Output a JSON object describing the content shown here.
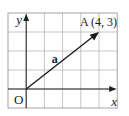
{
  "diagram": {
    "type": "vector-on-grid",
    "grid": {
      "columns": 6,
      "rows": 5,
      "left": 8,
      "top": 13,
      "cell_width": 18.2,
      "cell_height": 19,
      "line_color": "#b8b8b8",
      "border_color": "#9a9a9a"
    },
    "origin": {
      "label": "O",
      "grid_col": 1,
      "grid_row": 4
    },
    "axes": {
      "x_label": "x",
      "y_label": "y",
      "color": "#222222"
    },
    "vector": {
      "label": "a",
      "from": [
        0,
        0
      ],
      "to": [
        4,
        3
      ],
      "color": "#1a1a1a"
    },
    "point": {
      "name": "A",
      "label": "A (4, 3)",
      "x": 4,
      "y": 3
    }
  }
}
